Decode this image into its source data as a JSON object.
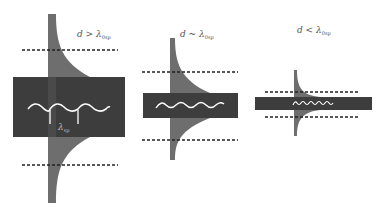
{
  "colors": {
    "slab": "#3d3d3d",
    "field": "#6e6e6e",
    "wave": "#ffffff",
    "dashed": "#222222",
    "background": "#ffffff",
    "text": "#555555"
  },
  "panels": [
    {
      "label_main": "d > λ",
      "label_sub": "0sp",
      "wave_label_main": "λ",
      "wave_label_sub": "sp",
      "description": "thick slab, field mostly confined"
    },
    {
      "label_main": "d ~ λ",
      "label_sub": "0sp",
      "description": "slab thickness comparable to wavelength"
    },
    {
      "label_main": "d < λ",
      "label_sub": "0sp",
      "description": "thin slab, field extends outside, shorter wavelength"
    }
  ]
}
